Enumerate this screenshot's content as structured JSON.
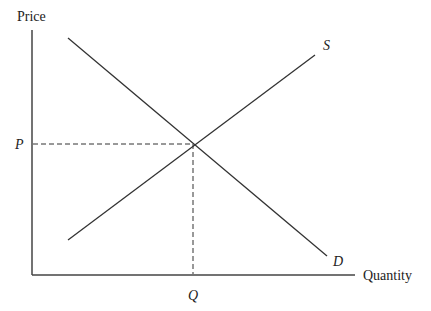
{
  "diagram": {
    "type": "supply-demand",
    "y_axis_label": "Price",
    "x_axis_label": "Quantity",
    "supply_label": "S",
    "demand_label": "D",
    "equilibrium_price_label": "P",
    "equilibrium_quantity_label": "Q",
    "colors": {
      "line": "#333333",
      "text": "#222222",
      "background": "#ffffff"
    }
  }
}
